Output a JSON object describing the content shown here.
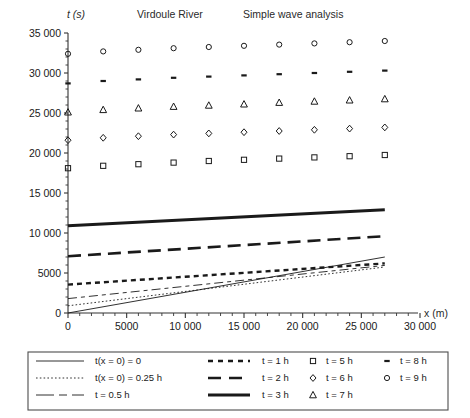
{
  "figure": {
    "title_left": "Virdoule River",
    "title_right": "Simple wave analysis",
    "yaxis_label": "t (s)",
    "xaxis_label": "x (m)"
  },
  "chart_data": {
    "type": "scatter",
    "title": "Virdoule River   Simple wave analysis",
    "xlabel": "x (m)",
    "ylabel": "t (s)",
    "xlim": [
      0,
      30000
    ],
    "ylim": [
      0,
      35000
    ],
    "xticks": [
      0,
      5000,
      10000,
      15000,
      20000,
      25000,
      30000
    ],
    "xticklabels": [
      "0",
      "5000",
      "10 000",
      "15 000",
      "20 000",
      "25 000",
      "30 000"
    ],
    "yticks": [
      0,
      5000,
      10000,
      15000,
      20000,
      25000,
      30000,
      35000
    ],
    "yticklabels": [
      "0",
      "5000",
      "10 000",
      "15 000",
      "20 000",
      "25 000",
      "30 000",
      "35 000"
    ],
    "xminor_step": 1000,
    "grid": false,
    "legend_position": "below-plot",
    "series": [
      {
        "name": "t(x = 0) = 0",
        "style": "line",
        "linestyle": "solid",
        "linewidth": 0.9,
        "x": [
          0,
          27000
        ],
        "values": [
          0,
          7000
        ]
      },
      {
        "name": "t(x = 0) = 0.25 h",
        "style": "line",
        "linestyle": "dotted",
        "linewidth": 0.9,
        "x": [
          0,
          27000
        ],
        "values": [
          900,
          5750
        ]
      },
      {
        "name": "t = 0.5 h",
        "style": "line",
        "linestyle": "dashdash",
        "linewidth": 0.9,
        "x": [
          0,
          27000
        ],
        "values": [
          1800,
          5950
        ]
      },
      {
        "name": "t = 1 h",
        "style": "line",
        "linestyle": "shortdash-thick",
        "linewidth": 2.4,
        "x": [
          0,
          27000
        ],
        "values": [
          3550,
          6200
        ]
      },
      {
        "name": "t = 2 h",
        "style": "line",
        "linestyle": "longdash-thick",
        "linewidth": 2.6,
        "x": [
          0,
          27000
        ],
        "values": [
          7100,
          9600
        ]
      },
      {
        "name": "t = 3 h",
        "style": "line",
        "linestyle": "solid-thick",
        "linewidth": 3.0,
        "x": [
          0,
          27000
        ],
        "values": [
          10900,
          12900
        ]
      },
      {
        "name": "t = 5 h",
        "style": "marker",
        "marker": "square",
        "x": [
          0,
          3000,
          6000,
          9000,
          12000,
          15000,
          18000,
          21000,
          24000,
          27000
        ],
        "values": [
          18100,
          18400,
          18600,
          18800,
          19000,
          19150,
          19300,
          19450,
          19600,
          19750
        ]
      },
      {
        "name": "t = 6 h",
        "style": "marker",
        "marker": "diamond",
        "x": [
          0,
          3000,
          6000,
          9000,
          12000,
          15000,
          18000,
          21000,
          24000,
          27000
        ],
        "values": [
          21600,
          21900,
          22100,
          22300,
          22450,
          22600,
          22750,
          22900,
          23050,
          23200
        ]
      },
      {
        "name": "t = 7 h",
        "style": "marker",
        "marker": "triangle",
        "x": [
          0,
          3000,
          6000,
          9000,
          12000,
          15000,
          18000,
          21000,
          24000,
          27000
        ],
        "values": [
          25100,
          25400,
          25600,
          25800,
          25950,
          26100,
          26300,
          26450,
          26600,
          26750
        ]
      },
      {
        "name": "t = 8 h",
        "style": "marker",
        "marker": "dash",
        "x": [
          0,
          3000,
          6000,
          9000,
          12000,
          15000,
          18000,
          21000,
          24000,
          27000
        ],
        "values": [
          28700,
          29000,
          29200,
          29400,
          29550,
          29700,
          29850,
          30000,
          30150,
          30300
        ]
      },
      {
        "name": "t = 9 h",
        "style": "marker",
        "marker": "circle",
        "x": [
          0,
          3000,
          6000,
          9000,
          12000,
          15000,
          18000,
          21000,
          24000,
          27000
        ],
        "values": [
          32400,
          32700,
          32900,
          33100,
          33250,
          33400,
          33550,
          33700,
          33850,
          34000
        ]
      }
    ]
  },
  "yticks": {
    "t0": "0",
    "t1": "5000",
    "t2": "10 000",
    "t3": "15 000",
    "t4": "20 000",
    "t5": "25 000",
    "t6": "30 000",
    "t7": "35 000"
  },
  "xticks": {
    "t0": "0",
    "t1": "5000",
    "t2": "10 000",
    "t3": "15 000",
    "t4": "20 000",
    "t5": "25 000",
    "t6": "30 000"
  },
  "legend": {
    "col1": [
      {
        "label": "t(x = 0) = 0",
        "swatch": "solid-thin"
      },
      {
        "label": "t(x = 0) = 0.25 h",
        "swatch": "dotted-thin"
      },
      {
        "label": "t = 0.5 h",
        "swatch": "dashdash-thin"
      }
    ],
    "col2": [
      {
        "label": "t = 1 h",
        "swatch": "shortdash-thick"
      },
      {
        "label": "t = 2 h",
        "swatch": "longdash-thick"
      },
      {
        "label": "t = 3 h",
        "swatch": "solid-thick"
      }
    ],
    "col3": [
      {
        "label": "t = 5 h",
        "swatch": "square-marker"
      },
      {
        "label": "t = 6 h",
        "swatch": "diamond-marker"
      },
      {
        "label": "t = 7 h",
        "swatch": "triangle-marker"
      }
    ],
    "col4": [
      {
        "label": "t = 8 h",
        "swatch": "dash-marker"
      },
      {
        "label": "t = 9 h",
        "swatch": "circle-marker"
      }
    ]
  },
  "colors": {
    "ink": "#1a1a1a",
    "axis": "#333333",
    "background": "#ffffff",
    "legend_border": "#4d4d4d"
  }
}
